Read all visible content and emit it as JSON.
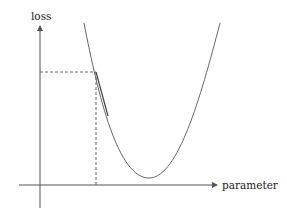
{
  "diagram": {
    "type": "loss-vs-parameter-curve",
    "y_axis_label": "loss",
    "x_axis_label": "parameter",
    "colors": {
      "axis": "#555555",
      "curve": "#666666",
      "dashed": "#666666",
      "tangent": "#555555"
    }
  }
}
